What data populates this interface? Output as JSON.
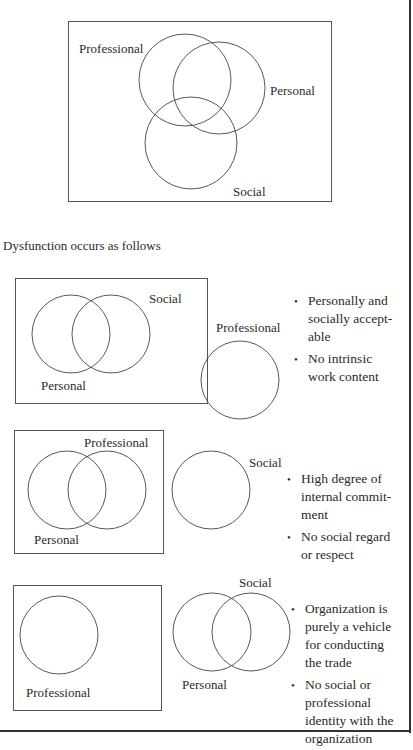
{
  "diagrams": [
    {
      "id": "integrated",
      "labels": {
        "professional": "Professional",
        "personal": "Personal",
        "social": "Social"
      }
    },
    {
      "id": "dysfunction-1",
      "labels": {
        "social": "Social",
        "personal": "Personal",
        "professional": "Professional"
      },
      "bullets": [
        "Personally and socially accept-able",
        "No intrinsic work content"
      ]
    },
    {
      "id": "dysfunction-2",
      "labels": {
        "professional": "Professional",
        "personal": "Personal",
        "social": "Social"
      },
      "bullets": [
        "High degree of internal commit-ment",
        "No social regard or respect"
      ]
    },
    {
      "id": "dysfunction-3",
      "labels": {
        "professional": "Professional",
        "personal": "Personal",
        "social": "Social"
      },
      "bullets": [
        "Organization is purely a vehicle for conducting the trade",
        "No social or professional identity with the organization"
      ]
    }
  ],
  "intro_text": "Dysfunction occurs as follows",
  "bullet_glyph": "•",
  "bullet_lines": {
    "d1": [
      [
        "Personally and",
        "socially accept-",
        "able"
      ],
      [
        "No intrinsic",
        "work content"
      ]
    ],
    "d2": [
      [
        "High degree of",
        "internal commit-",
        "ment"
      ],
      [
        "No social regard",
        "or respect"
      ]
    ],
    "d3": [
      [
        "Organization is",
        "purely a vehicle",
        "for conducting",
        "the trade"
      ],
      [
        "No social or",
        "professional",
        "identity with the",
        "organization"
      ]
    ]
  }
}
